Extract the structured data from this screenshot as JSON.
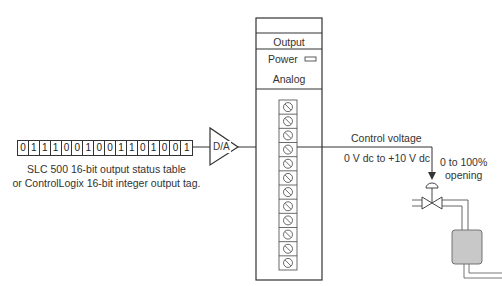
{
  "bit_register": {
    "bits": [
      "0",
      "1",
      "1",
      "1",
      "0",
      "0",
      "1",
      "0",
      "0",
      "1",
      "1",
      "0",
      "1",
      "0",
      "0",
      "1"
    ],
    "caption_line1": "SLC 500 16-bit output status table",
    "caption_line2": "or ControlLogix 16-bit integer output tag."
  },
  "converter": {
    "label": "D/A"
  },
  "module": {
    "output_label": "Output",
    "power_label": "Power",
    "analog_label": "Analog",
    "terminal_count": 12
  },
  "signal": {
    "line1": "Control voltage",
    "line2": "0 V dc to +10 V dc"
  },
  "valve": {
    "opening_line1": "0 to 100%",
    "opening_line2": "opening"
  },
  "colors": {
    "line": "#333333",
    "tank_fill": "#c8c8c8"
  }
}
